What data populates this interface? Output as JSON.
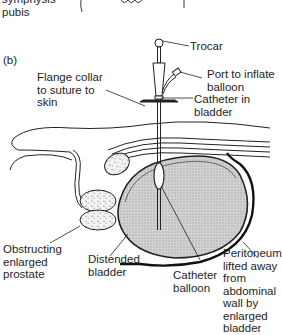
{
  "top_fragment": {
    "label": "symphysis\npubis"
  },
  "panel": {
    "label": "(b)"
  },
  "labels": {
    "trocar": "Trocar",
    "port": "Port to inflate\nballoon",
    "flange": "Flange collar\nto suture to\nskin",
    "catheter_in_bladder": "Catheter in\nbladder",
    "prostate": "Obstructing\nenlarged\nprostate",
    "distended_bladder": "Distended\nbladder",
    "catheter_balloon": "Catheter\nballoon",
    "peritoneum": "Peritoneum\nlifted away\nfrom\nabdominal\nwall by\nenlarged\nbladder"
  },
  "colors": {
    "ink": "#1a1a1a",
    "bladder_fill": "#bdbdbd",
    "background": "#ffffff"
  }
}
